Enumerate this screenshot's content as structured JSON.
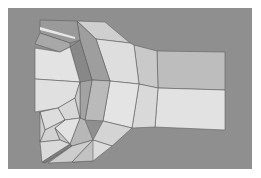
{
  "image": {
    "description": "Grayscale 3D polygon mesh rendering of a flared tube / elbow shape on gray background",
    "background_color": "#8f8f8f",
    "page_color": "#ffffff",
    "shades": {
      "lightest": "#e6e6e6",
      "light": "#dadada",
      "mid_light": "#c8c8c8",
      "mid": "#b4b4b4",
      "dark": "#9a9a9a",
      "darker": "#888888",
      "edge": "#5a5a5a"
    }
  }
}
